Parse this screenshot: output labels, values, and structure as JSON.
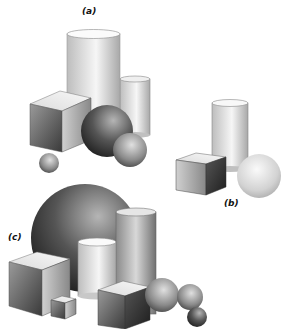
{
  "figure": {
    "panels": [
      {
        "label": "(a)",
        "shapes": [
          "tall-cylinder",
          "short-cylinder",
          "cube",
          "large-sphere",
          "medium-sphere",
          "small-sphere"
        ]
      },
      {
        "label": "(b)",
        "shapes": [
          "cylinder",
          "cube",
          "sphere"
        ]
      },
      {
        "label": "(c)",
        "shapes": [
          "large-sphere",
          "tall-cylinder",
          "short-cylinder",
          "large-cube",
          "small-cube",
          "medium-cube",
          "sphere",
          "sphere",
          "small-sphere"
        ]
      }
    ]
  },
  "colors": {
    "background": "#ffffff",
    "light": "#f4f4f4",
    "mid": "#9a9a9a",
    "dark": "#2e2e2e"
  }
}
